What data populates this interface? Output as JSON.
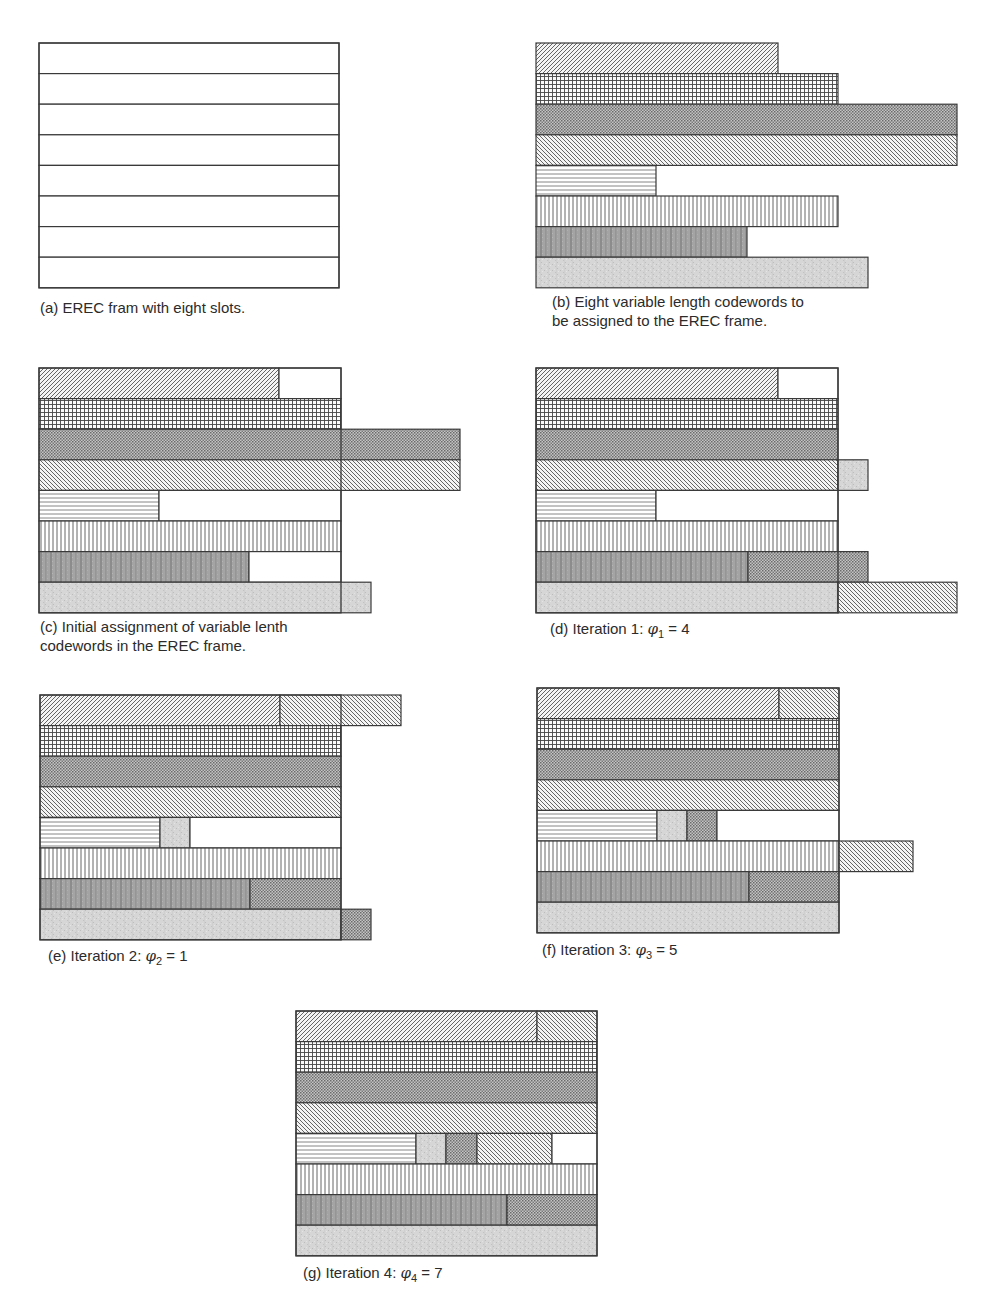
{
  "figure": {
    "row_height": 30.6,
    "patterns": {
      "empty": {
        "name": "empty-slot",
        "desc": "unfilled slot space"
      },
      "diag_fwd": {
        "name": "codeword-1-forward-diagonal-hatch"
      },
      "grid": {
        "name": "codeword-2-fine-grid-hatch"
      },
      "cross": {
        "name": "codeword-3-dark-crosshatch"
      },
      "diag_back": {
        "name": "codeword-4-backward-diagonal-hatch"
      },
      "horiz": {
        "name": "codeword-5-horizontal-lines"
      },
      "vert": {
        "name": "codeword-6-vertical-lines"
      },
      "darkvert": {
        "name": "codeword-7-dark-vertical-mottle"
      },
      "grey": {
        "name": "codeword-8-light-grey-mottle"
      }
    },
    "panels": [
      {
        "id": "a",
        "x0": 39,
        "y0": 43,
        "frame_width": 300,
        "show_frame": true,
        "caption": {
          "x": 40,
          "y": 298,
          "lines": [
            "(a) EREC fram with eight slots."
          ]
        },
        "rows": [
          [
            [
              "empty",
              300
            ]
          ],
          [
            [
              "empty",
              300
            ]
          ],
          [
            [
              "empty",
              300
            ]
          ],
          [
            [
              "empty",
              300
            ]
          ],
          [
            [
              "empty",
              300
            ]
          ],
          [
            [
              "empty",
              300
            ]
          ],
          [
            [
              "empty",
              300
            ]
          ],
          [
            [
              "empty",
              300
            ]
          ]
        ]
      },
      {
        "id": "b",
        "x0": 536,
        "y0": 43,
        "frame_width": 0,
        "show_frame": false,
        "caption": {
          "x": 552,
          "y": 292,
          "lines": [
            "(b) Eight variable length codewords to",
            "be assigned to the EREC frame."
          ]
        },
        "rows": [
          [
            [
              "diag_fwd",
              242
            ]
          ],
          [
            [
              "grid",
              302
            ]
          ],
          [
            [
              "cross",
              421
            ]
          ],
          [
            [
              "diag_back",
              421
            ]
          ],
          [
            [
              "horiz",
              120
            ]
          ],
          [
            [
              "vert",
              302
            ]
          ],
          [
            [
              "darkvert",
              211
            ]
          ],
          [
            [
              "grey",
              332
            ]
          ]
        ]
      },
      {
        "id": "c",
        "x0": 39,
        "y0": 368,
        "frame_width": 302,
        "show_frame": true,
        "caption": {
          "x": 46,
          "y": 617,
          "lines": [
            "(c) Initial assignment of variable lenth",
            "codewords in the EREC frame."
          ]
        },
        "rows": [
          [
            [
              "diag_fwd",
              240
            ],
            [
              "empty",
              62
            ]
          ],
          [
            [
              "grid",
              302
            ]
          ],
          [
            [
              "cross",
              421
            ]
          ],
          [
            [
              "diag_back",
              421
            ]
          ],
          [
            [
              "horiz",
              120
            ],
            [
              "empty",
              182
            ]
          ],
          [
            [
              "vert",
              302
            ]
          ],
          [
            [
              "darkvert",
              210
            ],
            [
              "empty",
              92
            ]
          ],
          [
            [
              "grey",
              332
            ]
          ]
        ]
      },
      {
        "id": "d",
        "x0": 536,
        "y0": 368,
        "frame_width": 302,
        "show_frame": true,
        "caption": {
          "x": 550,
          "y": 617,
          "lines": [
            "(d) Iteration 1: "
          ],
          "phi": {
            "sub": "1",
            "value": "4"
          }
        },
        "rows": [
          [
            [
              "diag_fwd",
              242
            ],
            [
              "empty",
              60
            ]
          ],
          [
            [
              "grid",
              302
            ]
          ],
          [
            [
              "cross",
              302
            ]
          ],
          [
            [
              "diag_back",
              302
            ],
            [
              "grey",
              30
            ]
          ],
          [
            [
              "horiz",
              120
            ],
            [
              "empty",
              182
            ]
          ],
          [
            [
              "vert",
              302
            ]
          ],
          [
            [
              "darkvert",
              212
            ],
            [
              "cross",
              120
            ]
          ],
          [
            [
              "grey",
              302
            ],
            [
              "diag_back",
              119
            ]
          ]
        ]
      },
      {
        "id": "e",
        "x0": 40,
        "y0": 695,
        "frame_width": 301,
        "show_frame": true,
        "caption": {
          "x": 48,
          "y": 945,
          "lines": [
            "(e) Iteration 2: "
          ],
          "phi": {
            "sub": "2",
            "value": "1"
          }
        },
        "rows": [
          [
            [
              "diag_fwd",
              240
            ],
            [
              "diag_back",
              121
            ]
          ],
          [
            [
              "grid",
              301
            ]
          ],
          [
            [
              "cross",
              301
            ]
          ],
          [
            [
              "diag_back",
              301
            ]
          ],
          [
            [
              "horiz",
              120
            ],
            [
              "grey",
              30
            ],
            [
              "empty",
              151
            ]
          ],
          [
            [
              "vert",
              301
            ]
          ],
          [
            [
              "darkvert",
              210
            ],
            [
              "cross",
              91
            ]
          ],
          [
            [
              "grey",
              301
            ],
            [
              "cross",
              30
            ]
          ]
        ]
      },
      {
        "id": "f",
        "x0": 537,
        "y0": 688,
        "frame_width": 302,
        "show_frame": true,
        "caption": {
          "x": 542,
          "y": 940,
          "lines": [
            "(f) Iteration 3: "
          ],
          "phi": {
            "sub": "3",
            "value": "5"
          }
        },
        "rows": [
          [
            [
              "diag_fwd",
              242
            ],
            [
              "diag_back",
              60
            ]
          ],
          [
            [
              "grid",
              302
            ]
          ],
          [
            [
              "cross",
              302
            ]
          ],
          [
            [
              "diag_back",
              302
            ]
          ],
          [
            [
              "horiz",
              120
            ],
            [
              "grey",
              30
            ],
            [
              "cross",
              30
            ],
            [
              "empty",
              122
            ]
          ],
          [
            [
              "vert",
              302
            ],
            [
              "diag_back",
              74
            ]
          ],
          [
            [
              "darkvert",
              212
            ],
            [
              "cross",
              90
            ]
          ],
          [
            [
              "grey",
              302
            ]
          ]
        ]
      },
      {
        "id": "g",
        "x0": 296,
        "y0": 1011,
        "frame_width": 301,
        "show_frame": true,
        "caption": {
          "x": 303,
          "y": 1263,
          "lines": [
            "(g) Iteration 4: "
          ],
          "phi": {
            "sub": "4",
            "value": "7"
          }
        },
        "rows": [
          [
            [
              "diag_fwd",
              241
            ],
            [
              "diag_back",
              60
            ]
          ],
          [
            [
              "grid",
              301
            ]
          ],
          [
            [
              "cross",
              301
            ]
          ],
          [
            [
              "diag_back",
              301
            ]
          ],
          [
            [
              "horiz",
              120
            ],
            [
              "grey",
              30
            ],
            [
              "cross",
              31
            ],
            [
              "diag_back",
              75
            ],
            [
              "empty",
              45
            ]
          ],
          [
            [
              "vert",
              301
            ]
          ],
          [
            [
              "darkvert",
              211
            ],
            [
              "cross",
              90
            ]
          ],
          [
            [
              "grey",
              301
            ]
          ]
        ]
      }
    ]
  },
  "captions": {
    "a": "(a) EREC fram with eight slots.",
    "b1": "(b) Eight variable length codewords to",
    "b2": "be assigned to the EREC frame.",
    "c1": "(c) Initial assignment of variable lenth",
    "c2": "codewords in the EREC frame.",
    "d": "(d) Iteration 1: ",
    "e": "(e) Iteration 2: ",
    "f": "(f) Iteration 3: ",
    "g": "(g) Iteration 4: ",
    "phi_symbol": "φ",
    "d_sub": "1",
    "d_val": " = 4",
    "e_sub": "2",
    "e_val": " = 1",
    "f_sub": "3",
    "f_val": " = 5",
    "g_sub": "4",
    "g_val": " = 7"
  },
  "colors": {
    "stroke": "#3a3a3a",
    "hatch": "#4a4a4a",
    "cross_bg": "#bdbdbd",
    "darkvert_bg": "#9a9a9a",
    "grey_bg": "#d2d2d2"
  }
}
